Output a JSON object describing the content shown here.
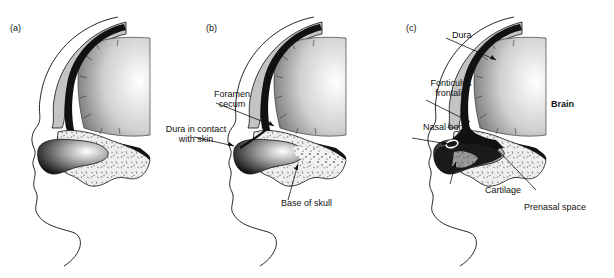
{
  "figure": {
    "panels": [
      {
        "id": "a",
        "label": "(a)",
        "annotations": []
      },
      {
        "id": "b",
        "label": "(b)",
        "annotations": [
          {
            "text_line1": "Foramen",
            "text_line2": "cecum"
          },
          {
            "text_line1": "Dura in contact",
            "text_line2": "with skin"
          },
          {
            "text_line1": "Base of skull"
          }
        ]
      },
      {
        "id": "c",
        "label": "(c)",
        "annotations": [
          {
            "text_line1": "Dura"
          },
          {
            "text_line1": "Fonticulus",
            "text_line2": "frontalis"
          },
          {
            "text_line1": "Brain"
          },
          {
            "text_line1": "Nasal bone"
          },
          {
            "text_line1": "Cartilage"
          },
          {
            "text_line1": "Prenasal space"
          }
        ]
      }
    ],
    "colors": {
      "ink": "#111111",
      "skull_gray": "#bdbdbd",
      "brain_light": "#f2f2f2",
      "brain_dark": "#8a8a8a",
      "base_speckle": "#e6e6e6"
    }
  }
}
